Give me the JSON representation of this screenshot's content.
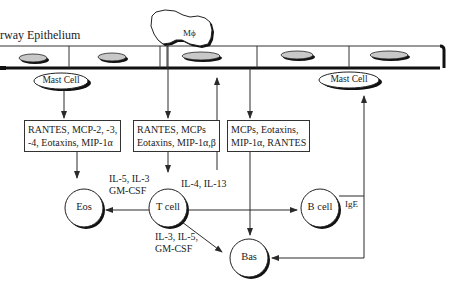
{
  "diagram": {
    "epithelium_label": "rway Epithelium",
    "macrophage_label": "Mϕ",
    "nodes": {
      "mast_cell_left": "Mast Cell",
      "mast_cell_right": "Mast Cell",
      "eos": "Eos",
      "t_cell": "T cell",
      "b_cell": "B cell",
      "bas": "Bas"
    },
    "boxes": {
      "mast_chemokines_line1": "RANTES, MCP-2, -3,",
      "mast_chemokines_line2": "-4, Eotaxins, MIP-1α",
      "epith_chemokines_line1": "RANTES, MCPs",
      "epith_chemokines_line2": "Eotaxins, MIP-1α,β",
      "bas_chemokines_line1": "MCPs, Eotaxins,",
      "bas_chemokines_line2": "MIP-1α, RANTES"
    },
    "edge_labels": {
      "tcell_to_eos_line1": "IL-5, IL-3",
      "tcell_to_eos_line2": "GM-CSF",
      "tcell_to_bcell": "IL-4, IL-13",
      "tcell_to_bas_line1": "IL-3, IL-5,",
      "tcell_to_bas_line2": "GM-CSF",
      "bcell_ige": "IgE"
    },
    "colors": {
      "line": "#2a2a2a",
      "cell_fill": "#c8c8c8",
      "background": "#ffffff"
    }
  }
}
